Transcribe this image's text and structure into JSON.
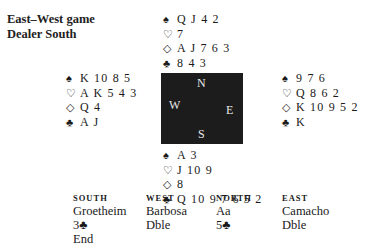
{
  "header": {
    "vulnerability": "East–West game",
    "dealer": "Dealer South"
  },
  "compass": {
    "n": "N",
    "s": "S",
    "w": "W",
    "e": "E"
  },
  "hands": {
    "north": {
      "spades": "Q J 4 2",
      "hearts": "7",
      "diamonds": "A J 7 6 3",
      "clubs": "8 4 3"
    },
    "west": {
      "spades": "K 10 8 5",
      "hearts": "A K 5 4 3",
      "diamonds": "Q 4",
      "clubs": "A J"
    },
    "east": {
      "spades": "9 7 6",
      "hearts": "Q 8 6 2",
      "diamonds": "K 10 9 5 2",
      "clubs": "K"
    },
    "south": {
      "spades": "A 3",
      "hearts": "J 10 9",
      "diamonds": "8",
      "clubs": "Q 10 9 7 6 5 2"
    }
  },
  "suit_icons": {
    "spades": "♠",
    "hearts": "♡",
    "diamonds": "◇",
    "clubs": "♣"
  },
  "bidding": {
    "columns": [
      {
        "seat": "SOUTH",
        "player": "Groetheim",
        "calls": [
          "3♣",
          "End"
        ]
      },
      {
        "seat": "WEST",
        "player": "Barbosa",
        "calls": [
          "Dble"
        ]
      },
      {
        "seat": "NORTH",
        "player": "Aa",
        "calls": [
          "5♣"
        ]
      },
      {
        "seat": "EAST",
        "player": "Camacho",
        "calls": [
          "Dble"
        ]
      }
    ]
  }
}
